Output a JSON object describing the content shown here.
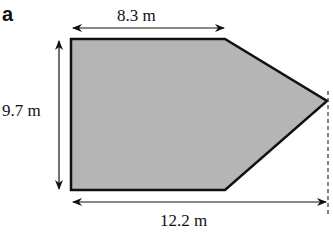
{
  "figure": {
    "part_label": "a",
    "shape": "pentagon (rectangle with triangular end)",
    "fill_color": "#b5b5b5",
    "stroke_color": "#111111",
    "dimensions": {
      "top_length": "8.3 m",
      "height": "9.7 m",
      "total_length": "12.2 m"
    }
  }
}
